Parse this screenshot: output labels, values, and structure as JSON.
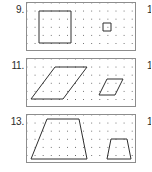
{
  "page": {
    "type": "math-worksheet-exercise-strip",
    "background_color": "#ffffff",
    "panel_border_color": "#8d8d8d",
    "figure_stroke_color": "#2f2f2f",
    "dot_color": "#555555"
  },
  "problems": [
    {
      "number_label": "9.",
      "right_label": "1",
      "grid": {
        "columns": 13,
        "rows": 6,
        "spacing_px": 8
      },
      "figures": [
        {
          "name": "large-square",
          "shape": "square",
          "points": "12,8 44,8 44,40 12,40 12,8"
        },
        {
          "name": "small-square",
          "shape": "square",
          "points": "76,20 84,20 84,28 76,28 76,20"
        }
      ]
    },
    {
      "number_label": "11.",
      "right_label": "1",
      "grid": {
        "columns": 13,
        "rows": 6,
        "spacing_px": 8
      },
      "figures": [
        {
          "name": "large-parallelogram",
          "shape": "parallelogram",
          "points": "28,8 60,8 36,40 4,40 28,8"
        },
        {
          "name": "small-parallelogram",
          "shape": "parallelogram",
          "points": "80,20 96,20 88,36 72,36 80,20"
        }
      ]
    },
    {
      "number_label": "13.",
      "right_label": "1",
      "grid": {
        "columns": 13,
        "rows": 6,
        "spacing_px": 8
      },
      "figures": [
        {
          "name": "large-trapezoid",
          "shape": "trapezoid",
          "points": "20,4 52,4 60,44 4,44 20,4"
        },
        {
          "name": "small-trapezoid",
          "shape": "trapezoid",
          "points": "84,24 100,24 104,44 80,44 84,24"
        }
      ]
    }
  ]
}
